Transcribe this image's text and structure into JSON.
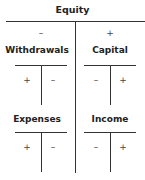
{
  "diagram": {
    "title": "Equity",
    "top_left": {
      "sign": "–",
      "account": "Withdrawals",
      "debit": "+",
      "credit": "–"
    },
    "top_right": {
      "sign": "+",
      "account": "Capital",
      "debit": "–",
      "credit": "+"
    },
    "bottom_left": {
      "account": "Expenses",
      "debit": "+",
      "credit": "–"
    },
    "bottom_right": {
      "account": "Income",
      "debit": "–",
      "credit": "+"
    }
  }
}
